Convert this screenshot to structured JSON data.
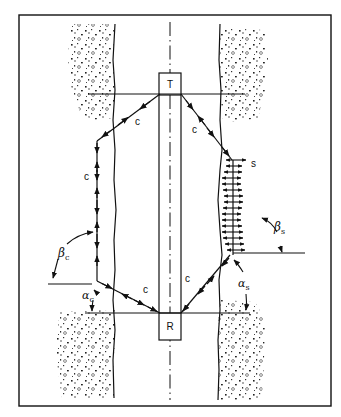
{
  "diagram": {
    "title": "",
    "tool": {
      "transmitter_label": "T",
      "receiver_label": "R"
    },
    "ray_labels": {
      "left_upper": "c",
      "left_vertical": "c",
      "left_lower": "c",
      "right_upper": "c",
      "right_lower": "c",
      "shear": "s"
    },
    "angles": {
      "beta_c": {
        "symbol": "β",
        "subscript": "c"
      },
      "alpha_c": {
        "symbol": "α",
        "subscript": "c"
      },
      "beta_s": {
        "symbol": "β",
        "subscript": "s"
      },
      "alpha_s": {
        "symbol": "α",
        "subscript": "s"
      }
    },
    "colors": {
      "line": "#111111",
      "background": "#ffffff"
    }
  }
}
